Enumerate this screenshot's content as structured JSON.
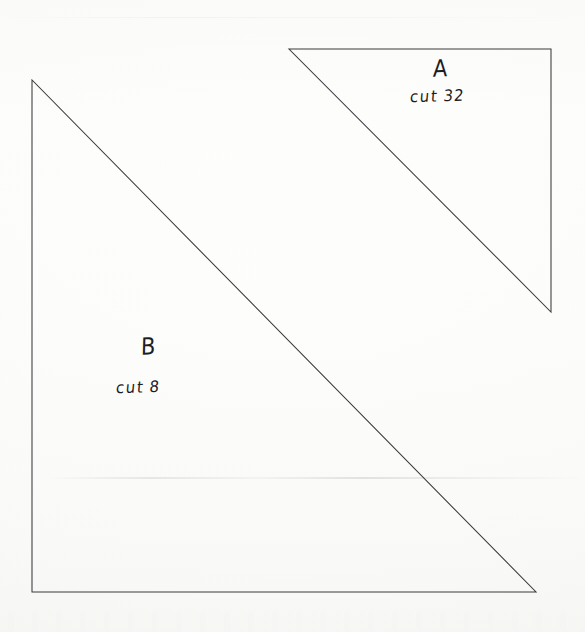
{
  "document": {
    "kind": "scanned-quilt-template-sheet",
    "background_color": "#fdfdfc",
    "ink_color": "#1d1d1f",
    "line_color": "#3a3a3c",
    "width": 585,
    "height": 632
  },
  "pieces": [
    {
      "id": "piece-a",
      "letter": "A",
      "cut_label": "cut",
      "cut_count": "32",
      "cut_text": "cut 32",
      "shape": "right-triangle",
      "right_angle_corner": "top-right",
      "vertices": [
        [
          289,
          49
        ],
        [
          551,
          49
        ],
        [
          551,
          312
        ]
      ],
      "label_letter_position": [
        442,
        70
      ],
      "label_cut_position": [
        448,
        99
      ]
    },
    {
      "id": "piece-b",
      "letter": "B",
      "cut_label": "cut",
      "cut_count": "8",
      "cut_text": "cut 8",
      "shape": "right-triangle",
      "right_angle_corner": "bottom-left",
      "vertices": [
        [
          32,
          80
        ],
        [
          32,
          592
        ],
        [
          536,
          592
        ]
      ],
      "label_letter_position": [
        150,
        348
      ],
      "label_cut_position": [
        154,
        390
      ]
    }
  ],
  "artifacts": {
    "scanner_seam_y": 478,
    "scanner_seam_top_y": 17,
    "bottom_noise_band_y": 612
  }
}
